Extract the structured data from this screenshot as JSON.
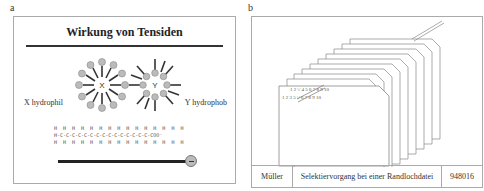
{
  "panels": [
    {
      "label": "a",
      "title": "Wirkung von Tensiden",
      "left_label": "X hydrophil",
      "right_label": "Y hydrophob",
      "micelle_x_label": "X",
      "micelle_y_label": "Y",
      "chain_top": "H  H  H  H  H  H  H  H  H  H  H  H  H  H  H",
      "chain_mid": "H-C-C-C-C-C-C-C-C-C-C-C-C-C-C-C-COO⁻",
      "chain_bottom": "H  H  H  H  H  H  H  H  H  H  H  H  H  H  H",
      "head_symbol": "minus-icon"
    },
    {
      "label": "b",
      "card_numbers_back": [
        "1",
        "2",
        "4",
        "5",
        "6",
        "7",
        "8",
        "9",
        "10"
      ],
      "card_numbers_front": [
        "1",
        "2",
        "3",
        "5",
        "6",
        "7",
        "8",
        "9",
        "10"
      ],
      "footer": {
        "author": "Müller",
        "caption": "Selektiervorgang bei einer Randlochdatei",
        "number": "948016"
      }
    }
  ],
  "colors": {
    "border": "#aaaaaa",
    "ink": "#222222",
    "head_fill": "#bbbbbb"
  }
}
